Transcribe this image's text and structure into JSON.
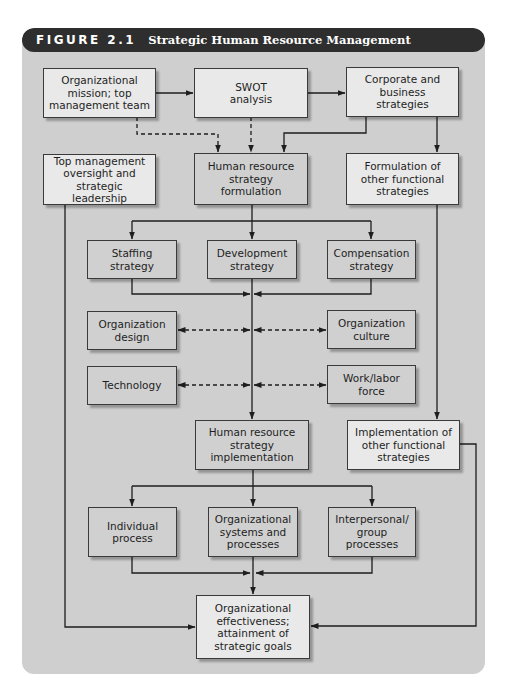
{
  "figure": {
    "number": "FIGURE 2.1",
    "title": "Strategic Human Resource Management"
  },
  "colors": {
    "background": "#cfcfcf",
    "header": "#2e2e2e",
    "box_light": "#e9e9e9",
    "box_dark": "#d0d0d0",
    "line": "#1e1e1e"
  },
  "nodes": {
    "mission": "Organizational\nmission; top\nmanagement team",
    "swot": "SWOT\nanalysis",
    "corporate": "Corporate and\nbusiness\nstrategies",
    "top_mgmt": "Top management\noversight and\nstrategic leadership",
    "hr_formulation": "Human resource\nstrategy\nformulation",
    "other_formulation": "Formulation of\nother functional\nstrategies",
    "staffing": "Staffing\nstrategy",
    "development": "Development\nstrategy",
    "compensation": "Compensation\nstrategy",
    "org_design": "Organization\ndesign",
    "org_culture": "Organization\nculture",
    "technology": "Technology",
    "work_labor": "Work/labor\nforce",
    "hr_implementation": "Human resource\nstrategy\nimplementation",
    "other_implementation": "Implementation of\nother functional\nstrategies",
    "individual": "Individual\nprocess",
    "org_systems": "Organizational\nsystems and\nprocesses",
    "interpersonal": "Interpersonal/\ngroup\nprocesses",
    "effectiveness": "Organizational\neffectiveness;\nattainment of\nstrategic goals"
  },
  "edges": [
    {
      "from": "mission",
      "to": "swot",
      "style": "solid"
    },
    {
      "from": "swot",
      "to": "corporate",
      "style": "solid"
    },
    {
      "from": "mission",
      "to": "hr_formulation",
      "style": "dashed"
    },
    {
      "from": "swot",
      "to": "hr_formulation",
      "style": "dashed"
    },
    {
      "from": "corporate",
      "to": "hr_formulation",
      "style": "solid"
    },
    {
      "from": "corporate",
      "to": "other_formulation",
      "style": "solid"
    },
    {
      "from": "hr_formulation",
      "to": "staffing",
      "style": "solid"
    },
    {
      "from": "hr_formulation",
      "to": "development",
      "style": "solid"
    },
    {
      "from": "hr_formulation",
      "to": "compensation",
      "style": "solid"
    },
    {
      "from": "staffing",
      "to": "hr_implementation",
      "style": "solid"
    },
    {
      "from": "development",
      "to": "hr_implementation",
      "style": "solid"
    },
    {
      "from": "compensation",
      "to": "hr_implementation",
      "style": "solid"
    },
    {
      "from": "org_design",
      "to": "hr_implementation",
      "style": "dashed-bidirectional"
    },
    {
      "from": "org_culture",
      "to": "hr_implementation",
      "style": "dashed-bidirectional"
    },
    {
      "from": "technology",
      "to": "hr_implementation",
      "style": "dashed-bidirectional"
    },
    {
      "from": "work_labor",
      "to": "hr_implementation",
      "style": "dashed-bidirectional"
    },
    {
      "from": "other_formulation",
      "to": "other_implementation",
      "style": "solid"
    },
    {
      "from": "hr_implementation",
      "to": "individual",
      "style": "solid"
    },
    {
      "from": "hr_implementation",
      "to": "org_systems",
      "style": "solid"
    },
    {
      "from": "hr_implementation",
      "to": "interpersonal",
      "style": "solid"
    },
    {
      "from": "individual",
      "to": "effectiveness",
      "style": "solid"
    },
    {
      "from": "org_systems",
      "to": "effectiveness",
      "style": "solid"
    },
    {
      "from": "interpersonal",
      "to": "effectiveness",
      "style": "solid"
    },
    {
      "from": "top_mgmt",
      "to": "effectiveness",
      "style": "solid"
    },
    {
      "from": "other_implementation",
      "to": "effectiveness",
      "style": "solid"
    }
  ]
}
